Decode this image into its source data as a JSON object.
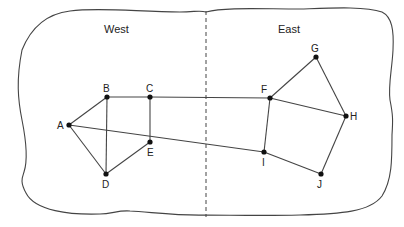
{
  "diagram": {
    "type": "graph",
    "regions": [
      {
        "id": "west",
        "label": "West",
        "x": 104,
        "y": 33
      },
      {
        "id": "east",
        "label": "East",
        "x": 278,
        "y": 33
      }
    ],
    "divider": {
      "x": 206,
      "y1": 11,
      "y2": 217,
      "style": "dashed"
    },
    "nodes": [
      {
        "id": "A",
        "label": "A",
        "x": 69,
        "y": 125,
        "lx": 57,
        "ly": 129
      },
      {
        "id": "B",
        "label": "B",
        "x": 107,
        "y": 97,
        "lx": 103,
        "ly": 92
      },
      {
        "id": "C",
        "label": "C",
        "x": 150,
        "y": 97,
        "lx": 146,
        "ly": 92
      },
      {
        "id": "D",
        "label": "D",
        "x": 106,
        "y": 174,
        "lx": 102,
        "ly": 188
      },
      {
        "id": "E",
        "label": "E",
        "x": 150,
        "y": 142,
        "lx": 147,
        "ly": 156
      },
      {
        "id": "F",
        "label": "F",
        "x": 270,
        "y": 98,
        "lx": 261,
        "ly": 93
      },
      {
        "id": "G",
        "label": "G",
        "x": 316,
        "y": 57,
        "lx": 311,
        "ly": 52
      },
      {
        "id": "H",
        "label": "H",
        "x": 346,
        "y": 116,
        "lx": 350,
        "ly": 120
      },
      {
        "id": "I",
        "label": "I",
        "x": 264,
        "y": 152,
        "lx": 262,
        "ly": 166
      },
      {
        "id": "J",
        "label": "J",
        "x": 321,
        "y": 174,
        "lx": 317,
        "ly": 188
      }
    ],
    "edges": [
      [
        "A",
        "B"
      ],
      [
        "A",
        "D"
      ],
      [
        "A",
        "I"
      ],
      [
        "B",
        "C"
      ],
      [
        "B",
        "D"
      ],
      [
        "C",
        "E"
      ],
      [
        "C",
        "F"
      ],
      [
        "D",
        "E"
      ],
      [
        "F",
        "G"
      ],
      [
        "F",
        "H"
      ],
      [
        "F",
        "I"
      ],
      [
        "G",
        "H"
      ],
      [
        "H",
        "J"
      ],
      [
        "I",
        "J"
      ]
    ],
    "colors": {
      "line": "#444444",
      "node": "#111111",
      "background": "#ffffff"
    }
  }
}
